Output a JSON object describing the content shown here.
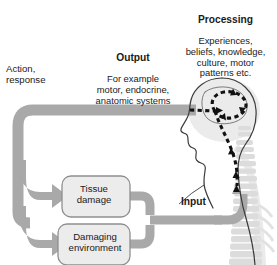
{
  "diagram": {
    "type": "flow-diagram",
    "background": "#ffffff",
    "palette": {
      "arrow_gray": "#a9a9a9",
      "arrow_gray_dark": "#9a9a9a",
      "box_fill": "#ececec",
      "box_stroke": "#8f8f8f",
      "body_stroke": "#3a3a3a",
      "skeleton_gray": "#dcdcdc",
      "brain_fill": "#ededed",
      "dash_black": "#111111",
      "text": "#1a1a1a"
    }
  },
  "labels": {
    "processing": {
      "heading": "Processing",
      "body": "Experiences,\nbeliefs, knowledge,\nculture, motor\npatterns etc."
    },
    "output": {
      "heading": "Output",
      "body": "For example\nmotor, endocrine,\nanatomic systems"
    },
    "action": {
      "text": "Action,\nresponse"
    },
    "input": {
      "text": "Input"
    }
  },
  "nodes": [
    {
      "id": "tissue-damage",
      "label": "Tissue\ndamage"
    },
    {
      "id": "damaging-environment",
      "label": "Damaging\nenvironment"
    }
  ],
  "flow": [
    {
      "from": "processing",
      "to": "output"
    },
    {
      "from": "output",
      "to": "action-response"
    },
    {
      "from": "action-response",
      "to": "tissue-damage"
    },
    {
      "from": "action-response",
      "to": "damaging-environment"
    },
    {
      "from": "tissue-damage",
      "to": "input"
    },
    {
      "from": "damaging-environment",
      "to": "input"
    },
    {
      "from": "input",
      "to": "processing"
    }
  ],
  "figure": {
    "parts": [
      "head-profile",
      "brain-outline",
      "spine-vertebrae",
      "dashed-brain-loop",
      "dashed-spine-path"
    ]
  }
}
